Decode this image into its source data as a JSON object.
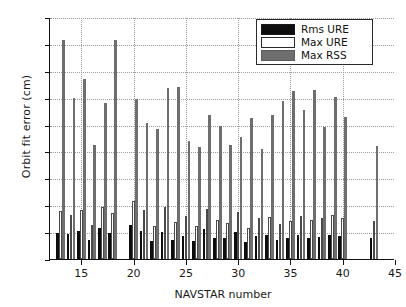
{
  "chart_data": {
    "type": "bar",
    "title": "",
    "xlabel": "NAVSTAR number",
    "ylabel": "Orbit fit error (cm)",
    "xlim": [
      12,
      45
    ],
    "ylim": [
      0,
      90
    ],
    "ytick_step": 10,
    "yticks": [
      0,
      10,
      20,
      30,
      40,
      50,
      60,
      70,
      80,
      90
    ],
    "xticks": [
      15,
      20,
      25,
      30,
      35,
      40,
      45
    ],
    "grid": "dotted",
    "legend_position": "top-right",
    "categories": [
      13,
      14,
      15,
      16,
      17,
      18,
      20,
      21,
      22,
      23,
      24,
      25,
      26,
      27,
      28,
      29,
      30,
      31,
      32,
      33,
      34,
      35,
      36,
      37,
      38,
      39,
      40,
      43
    ],
    "series": [
      {
        "name": "Rms URE",
        "color": "#0d0d0d",
        "values": [
          9.6,
          9.4,
          10.3,
          7.0,
          11.6,
          9.7,
          12.7,
          10.5,
          6.7,
          10.2,
          7.2,
          8.6,
          6.7,
          11.2,
          8.0,
          7.7,
          10.1,
          6.3,
          8.6,
          9.0,
          7.0,
          7.7,
          8.9,
          7.9,
          8.3,
          9.1,
          8.6,
          7.8
        ]
      },
      {
        "name": "Max URE",
        "color": "#ffffff",
        "values": [
          17.9,
          16.3,
          18.4,
          12.5,
          19.5,
          17.2,
          21.4,
          18.3,
          12.1,
          19.3,
          13.7,
          15.9,
          12.4,
          18.6,
          14.6,
          13.5,
          17.6,
          11.6,
          15.1,
          15.8,
          12.9,
          14.1,
          16.0,
          14.4,
          15.2,
          16.3,
          15.4,
          14.3
        ]
      },
      {
        "name": "Max RSS",
        "color": "#6e6e6e",
        "values": [
          81.3,
          59.8,
          66.8,
          42.5,
          58.2,
          81.3,
          59.6,
          50.6,
          48.4,
          63.6,
          64.0,
          44.0,
          41.7,
          53.6,
          49.6,
          42.3,
          45.2,
          52.5,
          41.0,
          53.7,
          58.7,
          62.4,
          55.6,
          62.8,
          49.0,
          60.1,
          53.0,
          42.0
        ]
      }
    ]
  },
  "legend": {
    "items": [
      {
        "label": "Rms URE",
        "swatch": "k"
      },
      {
        "label": "Max URE",
        "swatch": "w"
      },
      {
        "label": "Max RSS",
        "swatch": "g"
      }
    ]
  }
}
